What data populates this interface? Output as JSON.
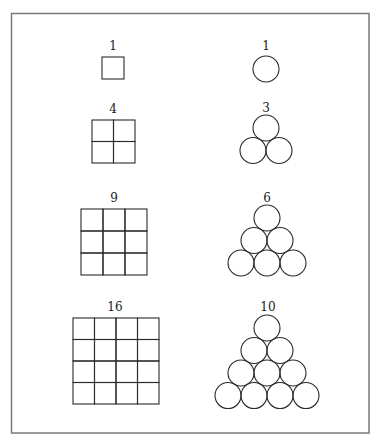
{
  "figure": {
    "frame_color": "#7a7a7a",
    "stroke_color": "#2a2a2a"
  },
  "squares": [
    {
      "label": "1",
      "n": 1,
      "x": 102,
      "y": 57,
      "cell": 22
    },
    {
      "label": "4",
      "n": 2,
      "x": 92,
      "y": 120,
      "cell": 21.5
    },
    {
      "label": "9",
      "n": 3,
      "x": 81,
      "y": 209,
      "cell": 22
    },
    {
      "label": "16",
      "n": 4,
      "x": 73,
      "y": 318,
      "cell": 21.5
    }
  ],
  "triangles": [
    {
      "label": "1",
      "rows": 1,
      "top_cx": 266,
      "top_cy": 69,
      "r": 13
    },
    {
      "label": "3",
      "rows": 2,
      "top_cx": 266,
      "top_cy": 128,
      "r": 13
    },
    {
      "label": "6",
      "rows": 3,
      "top_cx": 267,
      "top_cy": 218,
      "r": 13
    },
    {
      "label": "10",
      "rows": 4,
      "top_cx": 267,
      "top_cy": 328,
      "r": 13
    }
  ]
}
